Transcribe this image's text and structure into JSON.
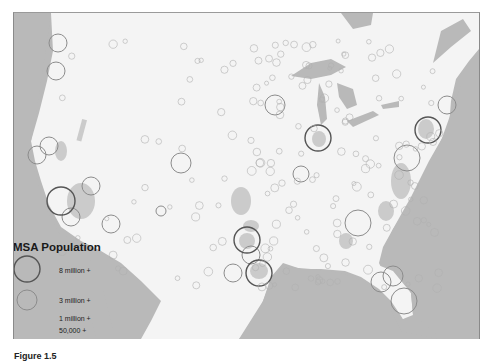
{
  "figure": {
    "caption_partial": "Figure 1.5"
  },
  "legend": {
    "title": "MSA Population",
    "entries": [
      {
        "label": "8 million +",
        "radius": 13,
        "stroke": "#555555",
        "stroke_width": 1.4
      },
      {
        "label": "3 million +",
        "radius": 10,
        "stroke": "#8c8c8c",
        "stroke_width": 1.0
      },
      {
        "label": "1 million +",
        "radius": 0,
        "stroke": "#9a9a9a",
        "stroke_width": 0.8
      },
      {
        "label": "50,000 +",
        "radius": 0,
        "stroke": "#a8a8a8",
        "stroke_width": 0.6
      }
    ]
  },
  "colors": {
    "water": "#b9b9b9",
    "land": "#f4f4f4",
    "urban": "#c8c8c8",
    "large_circle": "#555555",
    "medium_circle": "#8c8c8c",
    "small_circle": "#b0b0b0"
  },
  "msa_circles": {
    "large": [
      {
        "x": 317,
        "y": 137,
        "r": 13
      },
      {
        "x": 427,
        "y": 129,
        "r": 13
      },
      {
        "x": 60,
        "y": 200,
        "r": 14
      },
      {
        "x": 258,
        "y": 272,
        "r": 13
      },
      {
        "x": 246,
        "y": 239,
        "r": 13
      }
    ],
    "medium": [
      {
        "x": 57,
        "y": 42,
        "r": 9
      },
      {
        "x": 55,
        "y": 70,
        "r": 9
      },
      {
        "x": 48,
        "y": 145,
        "r": 9
      },
      {
        "x": 36,
        "y": 154,
        "r": 9
      },
      {
        "x": 90,
        "y": 185,
        "r": 9
      },
      {
        "x": 70,
        "y": 216,
        "r": 9
      },
      {
        "x": 110,
        "y": 223,
        "r": 9
      },
      {
        "x": 180,
        "y": 162,
        "r": 10
      },
      {
        "x": 274,
        "y": 104,
        "r": 10
      },
      {
        "x": 357,
        "y": 222,
        "r": 13
      },
      {
        "x": 406,
        "y": 157,
        "r": 13
      },
      {
        "x": 446,
        "y": 104,
        "r": 9
      },
      {
        "x": 232,
        "y": 272,
        "r": 9
      },
      {
        "x": 250,
        "y": 254,
        "r": 9
      },
      {
        "x": 380,
        "y": 281,
        "r": 10
      },
      {
        "x": 392,
        "y": 275,
        "r": 10
      },
      {
        "x": 403,
        "y": 300,
        "r": 13
      },
      {
        "x": 300,
        "y": 173,
        "r": 8
      },
      {
        "x": 160,
        "y": 210,
        "r": 5
      }
    ]
  }
}
